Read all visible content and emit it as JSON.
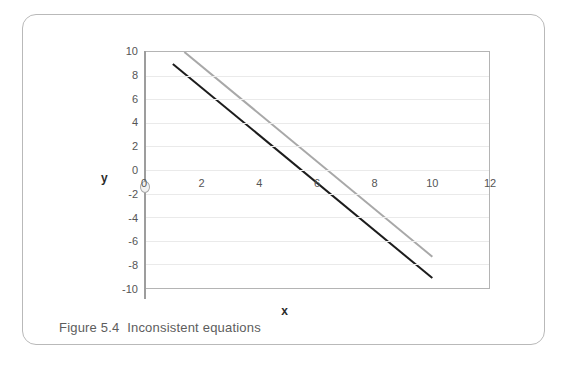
{
  "figure": {
    "caption": "Figure 5.4  Inconsistent equations",
    "card_border_color": "#b9b9b9"
  },
  "axes": {
    "x_title": "x",
    "y_title": "y",
    "x_ticks": [
      "0",
      "2",
      "4",
      "6",
      "8",
      "10",
      "12"
    ],
    "y_ticks": [
      "10",
      "8",
      "6",
      "4",
      "2",
      "0",
      "-2",
      "-4",
      "-6",
      "-8",
      "-10"
    ],
    "origin_label": "0",
    "axis_color": "#9d9d9d",
    "grid_color": "#eaeaea",
    "plot_border_color": "#b4b4b4",
    "tick_label_color": "#555555"
  },
  "chart_data": {
    "type": "line",
    "title": "Figure 5.4  Inconsistent equations",
    "xlabel": "x",
    "ylabel": "y",
    "xlim": [
      0,
      12
    ],
    "ylim": [
      -10,
      10
    ],
    "xticks": [
      0,
      2,
      4,
      6,
      8,
      10,
      12
    ],
    "yticks": [
      10,
      8,
      6,
      4,
      2,
      0,
      -2,
      -4,
      -6,
      -8,
      -10
    ],
    "grid": true,
    "legend": "none",
    "annotation": "Two parallel lines that never intersect, illustrating an inconsistent system of equations.",
    "series": [
      {
        "name": "line-1",
        "color": "#1c1c1c",
        "width": 2,
        "points": [
          [
            1,
            9
          ],
          [
            10,
            -9
          ]
        ],
        "slope": -2,
        "intercept": 11
      },
      {
        "name": "line-2",
        "color": "#a8a8a8",
        "width": 2,
        "points": [
          [
            1.4,
            10
          ],
          [
            10,
            -7.2
          ]
        ],
        "slope": -2,
        "intercept": 12.8
      }
    ]
  }
}
